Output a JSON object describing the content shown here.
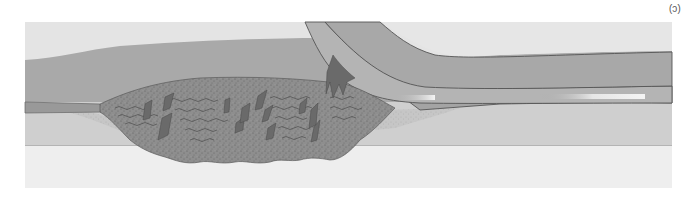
{
  "figure": {
    "panel_label": "(c)",
    "orientation": "rotated-180",
    "colors": {
      "background": "#ffffff",
      "outer_tissue_top": "#e6e6e6",
      "vessel_wall": "#a8a8a8",
      "lumen": "#9a9a9a",
      "catheter": "#b3b3b3",
      "catheter_outline": "#555555",
      "plaque": "#8c8c8c",
      "plaque_fragments": "#6a6a6a",
      "lower_tissue": "#cfcfcf",
      "bottom_tissue": "#eeeeee",
      "stent_highlight": "#f2f2f2"
    },
    "elements": [
      {
        "name": "upper-tissue",
        "label": ""
      },
      {
        "name": "vessel-wall",
        "label": ""
      },
      {
        "name": "catheter",
        "label": ""
      },
      {
        "name": "plaque",
        "label": ""
      },
      {
        "name": "stent-marker-1",
        "label": ""
      },
      {
        "name": "stent-marker-2",
        "label": ""
      },
      {
        "name": "lower-tissue",
        "label": ""
      }
    ]
  }
}
